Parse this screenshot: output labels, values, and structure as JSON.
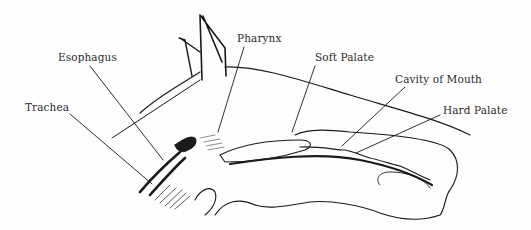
{
  "diagram": {
    "labels": [
      {
        "id": "esophagus",
        "text": "Esophagus",
        "x": 58,
        "y": 51
      },
      {
        "id": "trachea",
        "text": "Trachea",
        "x": 25,
        "y": 101
      },
      {
        "id": "pharynx",
        "text": "Pharynx",
        "x": 237,
        "y": 32
      },
      {
        "id": "soft-palate",
        "text": "Soft Palate",
        "x": 315,
        "y": 51
      },
      {
        "id": "cavity-of-mouth",
        "text": "Cavity of Mouth",
        "x": 395,
        "y": 73
      },
      {
        "id": "hard-palate",
        "text": "Hard Palate",
        "x": 443,
        "y": 104
      }
    ],
    "colors": {
      "ink": "#1a1a1a",
      "background": "#fdfdfd"
    }
  }
}
